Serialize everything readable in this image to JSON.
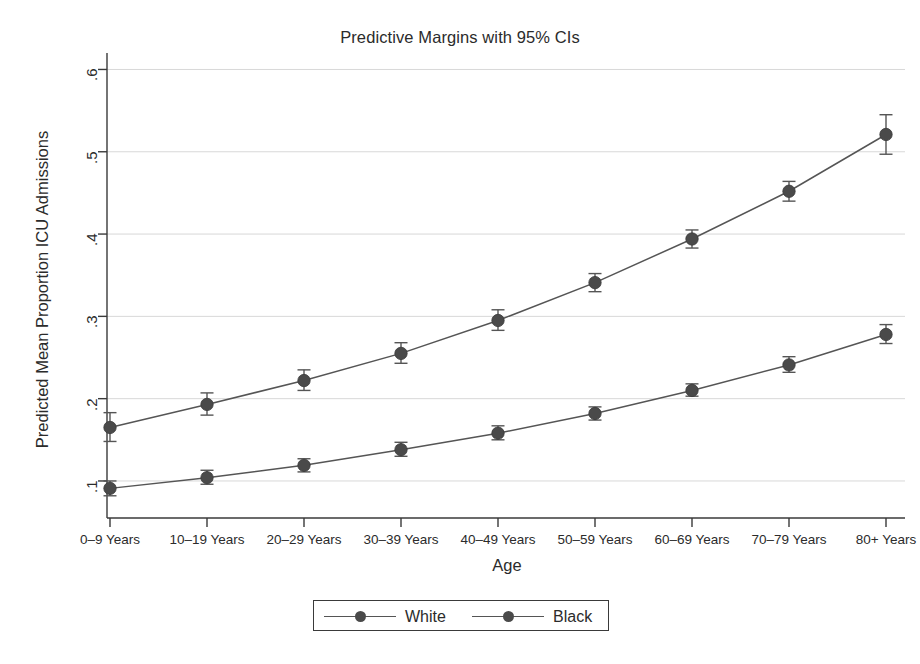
{
  "chart_data": {
    "type": "line",
    "title": "Predictive Margins with 95% CIs",
    "xlabel": "Age",
    "ylabel": "Predicted Mean Proportion ICU Admissions",
    "categories": [
      "0–9 Years",
      "10–19 Years",
      "20–29 Years",
      "30–39 Years",
      "40–49 Years",
      "50–59 Years",
      "60–69 Years",
      "70–79 Years",
      "80+ Years"
    ],
    "ylim": [
      0.055,
      0.62
    ],
    "yticks": [
      0.1,
      0.2,
      0.3,
      0.4,
      0.5,
      0.6
    ],
    "ytick_labels": [
      ".1",
      ".2",
      ".3",
      ".4",
      ".5",
      ".6"
    ],
    "grid": "horizontal",
    "legend_position": "bottom-center",
    "series": [
      {
        "name": "White",
        "values": [
          0.165,
          0.193,
          0.222,
          0.255,
          0.295,
          0.341,
          0.394,
          0.452,
          0.521
        ],
        "ci_low": [
          0.148,
          0.18,
          0.21,
          0.243,
          0.283,
          0.33,
          0.383,
          0.44,
          0.497
        ],
        "ci_high": [
          0.183,
          0.207,
          0.235,
          0.268,
          0.308,
          0.352,
          0.405,
          0.464,
          0.545
        ]
      },
      {
        "name": "Black",
        "values": [
          0.091,
          0.104,
          0.119,
          0.138,
          0.158,
          0.182,
          0.21,
          0.241,
          0.278
        ],
        "ci_low": [
          0.082,
          0.096,
          0.111,
          0.13,
          0.15,
          0.174,
          0.203,
          0.232,
          0.267
        ],
        "ci_high": [
          0.1,
          0.113,
          0.127,
          0.147,
          0.167,
          0.19,
          0.218,
          0.251,
          0.29
        ]
      }
    ],
    "colors": {
      "marker": "#4a4a4a",
      "line": "#555555",
      "grid": "#d8d8d8",
      "axis": "#3a3a3a"
    }
  },
  "legend": {
    "entries": [
      {
        "label": "White"
      },
      {
        "label": "Black"
      }
    ]
  }
}
